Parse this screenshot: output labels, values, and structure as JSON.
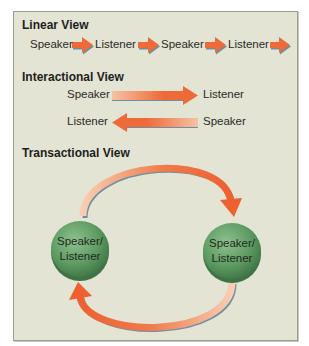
{
  "colors": {
    "panel_bg": "#e3e4d3",
    "arrow_orange": "#ee6a38",
    "arrow_light": "#f6c2a4",
    "arrow_shadow": "#6f8fa0",
    "node_green": "#5e9b62",
    "node_green_dark": "#3e7344"
  },
  "linear": {
    "title": "Linear View",
    "nodes": [
      "Speaker",
      "Listener",
      "Speaker",
      "Listener"
    ]
  },
  "interactional": {
    "title": "Interactional View",
    "row1": {
      "from": "Speaker",
      "to": "Listener"
    },
    "row2": {
      "to": "Listener",
      "from": "Speaker"
    }
  },
  "transactional": {
    "title": "Transactional View",
    "left_node": "Speaker/\nListener",
    "right_node": "Speaker/\nListener"
  }
}
